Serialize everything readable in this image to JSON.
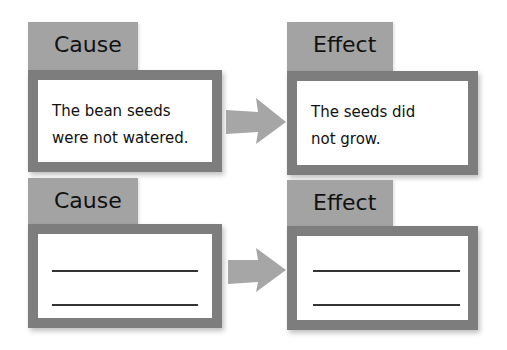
{
  "rows": [
    {
      "cause": {
        "label": "Cause",
        "text": "The bean seeds\nwere not watered."
      },
      "effect": {
        "label": "Effect",
        "text": "The seeds did\nnot grow."
      }
    },
    {
      "cause": {
        "label": "Cause",
        "text": ""
      },
      "effect": {
        "label": "Effect",
        "text": ""
      }
    }
  ],
  "colors": {
    "tab": "#a3a3a3",
    "frame": "#7d7d7d",
    "arrow": "#a6a6a6"
  }
}
